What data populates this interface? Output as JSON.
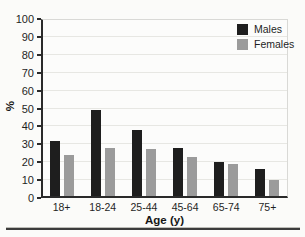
{
  "chart_data": {
    "type": "bar",
    "title": "",
    "categories": [
      "18+",
      "18-24",
      "25-44",
      "45-64",
      "65-74",
      "75+"
    ],
    "series": [
      {
        "name": "Males",
        "color": "#1e1e1e",
        "values": [
          31,
          48,
          37,
          27,
          19,
          15
        ]
      },
      {
        "name": "Females",
        "color": "#9b9b9b",
        "values": [
          23,
          27,
          26,
          22,
          18,
          9
        ]
      }
    ],
    "xlabel": "Age (y)",
    "ylabel": "%",
    "ylim": [
      0,
      100
    ],
    "ytick_interval": 10,
    "yticks": [
      "0",
      "10",
      "20",
      "30",
      "40",
      "50",
      "60",
      "70",
      "80",
      "90",
      "100"
    ],
    "grid": "faint horizontal gridlines every 10",
    "legend_position": "top-right inside plot",
    "legend": [
      "Males",
      "Females"
    ]
  }
}
